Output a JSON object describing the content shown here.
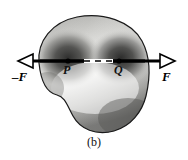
{
  "figure": {
    "caption": "(b)",
    "body": {
      "name": "irregular-rigid-body",
      "fill_light": "#f2f2f0",
      "fill_mid": "#9a9a98",
      "fill_dark": "#2f2f2e",
      "outline_color": "#1a1a1a"
    },
    "axis_line": {
      "name": "line-of-action",
      "color": "#000000",
      "y": 61,
      "x_start": 18,
      "x_end": 175
    },
    "dashed_segment": {
      "color": "#000000",
      "x_start": 84,
      "x_end": 113
    },
    "points": [
      {
        "id": "P",
        "label": "P",
        "x": 68,
        "y": 61,
        "marker": "dot"
      },
      {
        "id": "Q",
        "label": "Q",
        "x": 119,
        "y": 61,
        "marker": "dot"
      }
    ],
    "forces": [
      {
        "id": "neg-F",
        "label": "–F",
        "direction": "left",
        "arrowhead": "hollow-triangle",
        "tip_x": 18,
        "tail_x": 145,
        "y": 61
      },
      {
        "id": "pos-F",
        "label": "F",
        "direction": "right",
        "arrowhead": "hollow-triangle",
        "tip_x": 175,
        "tail_x": 40,
        "y": 61
      }
    ]
  }
}
